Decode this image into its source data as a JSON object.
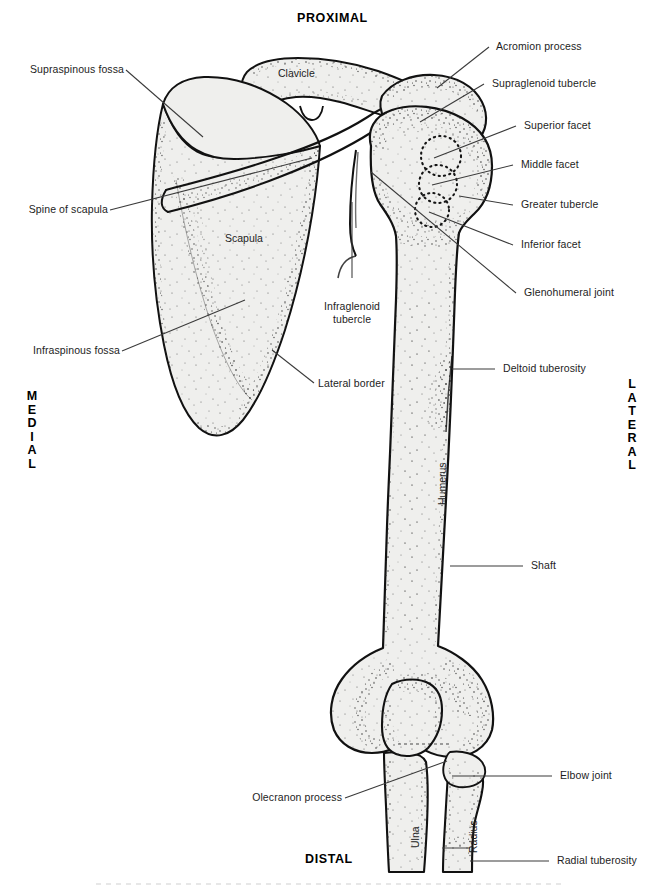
{
  "figure": {
    "title_top": "PROXIMAL",
    "title_bottom": "DISTAL",
    "side_left": "MEDIAL",
    "side_right": "LATERAL",
    "view": "anterior",
    "colors": {
      "ink": "#1a1a1a",
      "bone_fill": "#efefed",
      "outline": "#111111",
      "leader": "#3a3a3a",
      "stipple": "#2a2a2a",
      "footer_rule": "#c9c9c9"
    }
  },
  "bone_labels": [
    {
      "key": "clavicle",
      "text": "Clavicle"
    },
    {
      "key": "scapula",
      "text": "Scapula"
    },
    {
      "key": "humerus",
      "text": "Humerus"
    },
    {
      "key": "ulna",
      "text": "Ulna"
    },
    {
      "key": "radius",
      "text": "Radius"
    }
  ],
  "callouts_left": [
    {
      "key": "supraspinous-fossa",
      "text": "Supraspinous fossa"
    },
    {
      "key": "spine-of-scapula",
      "text": "Spine of scapula"
    },
    {
      "key": "infraspinous-fossa",
      "text": "Infraspinous fossa"
    },
    {
      "key": "lateral-border",
      "text": "Lateral border"
    },
    {
      "key": "olecranon-process",
      "text": "Olecranon process"
    }
  ],
  "callouts_right": [
    {
      "key": "acromion-process",
      "text": "Acromion process"
    },
    {
      "key": "supraglenoid-tubercle",
      "text": "Supraglenoid tubercle"
    },
    {
      "key": "superior-facet",
      "text": "Superior facet"
    },
    {
      "key": "middle-facet",
      "text": "Middle facet"
    },
    {
      "key": "greater-tubercle",
      "text": "Greater tubercle"
    },
    {
      "key": "inferior-facet",
      "text": "Inferior facet"
    },
    {
      "key": "glenohumeral-joint",
      "text": "Glenohumeral joint"
    },
    {
      "key": "deltoid-tuberosity",
      "text": "Deltoid tuberosity"
    },
    {
      "key": "shaft",
      "text": "Shaft"
    },
    {
      "key": "elbow-joint",
      "text": "Elbow joint"
    },
    {
      "key": "radial-tuberosity",
      "text": "Radial tuberosity"
    }
  ],
  "callouts_center": [
    {
      "key": "infraglenoid-tubercle",
      "line1": "Infraglenoid",
      "line2": "tubercle"
    }
  ]
}
